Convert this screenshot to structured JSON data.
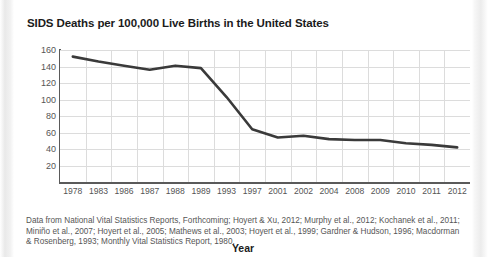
{
  "chart_data": {
    "type": "line",
    "title": "SIDS Deaths per 100,000 Live Births in the United States",
    "xlabel": "Year",
    "ylabel": "",
    "categories": [
      "1978",
      "1983",
      "1986",
      "1987",
      "1988",
      "1989",
      "1993",
      "1997",
      "2001",
      "2002",
      "2004",
      "2008",
      "2009",
      "2010",
      "2011",
      "2012"
    ],
    "values": [
      152,
      146,
      141,
      136,
      141,
      138,
      103,
      64,
      54,
      56,
      52,
      51,
      51,
      47,
      45,
      42
    ],
    "series": [
      {
        "name": "SIDS deaths per 100,000 live births",
        "values": [
          152,
          146,
          141,
          136,
          141,
          138,
          103,
          64,
          54,
          56,
          52,
          51,
          51,
          47,
          45,
          42
        ]
      }
    ],
    "ylim": [
      0,
      160
    ],
    "yticks": [
      160,
      140,
      120,
      100,
      80,
      60,
      40,
      20
    ],
    "grid": true,
    "legend": "none",
    "line_color": "#3a3a3a"
  },
  "caption": {
    "text": "Data from National Vital Statistics Reports, Forthcoming; Hoyert & Xu, 2012; Murphy et al., 2012; Kochanek et al., 2011; Miniño et al., 2007; Hoyert et al., 2005; Mathews et al., 2003; Hoyert et al., 1999; Gardner & Hudson, 1996; Macdorman & Rosenberg, 1993; Monthly Vital Statistics Report, 1980."
  }
}
